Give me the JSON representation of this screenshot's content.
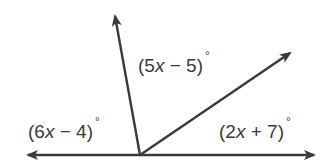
{
  "diagram": {
    "type": "angles-on-a-line",
    "colors": {
      "line": "#3a3a3a",
      "text": "#3a3a3a",
      "background": "#ffffff"
    },
    "vertex": {
      "x": 140,
      "y": 155
    },
    "rays": [
      {
        "name": "left-ray",
        "tip": {
          "x": 28,
          "y": 155
        }
      },
      {
        "name": "right-ray",
        "tip": {
          "x": 314,
          "y": 155
        }
      },
      {
        "name": "up-ray",
        "tip": {
          "x": 115,
          "y": 16
        }
      },
      {
        "name": "diagonal-ray",
        "tip": {
          "x": 290,
          "y": 53
        }
      }
    ],
    "angles": [
      {
        "id": "left-angle",
        "pre": "(6",
        "var": "x",
        "post": " − 4)",
        "deg": "°"
      },
      {
        "id": "middle-angle",
        "pre": "(5",
        "var": "x",
        "post": " − 5)",
        "deg": "°"
      },
      {
        "id": "right-angle",
        "pre": "(2",
        "var": "x",
        "post": " + 7)",
        "deg": "°"
      }
    ]
  }
}
